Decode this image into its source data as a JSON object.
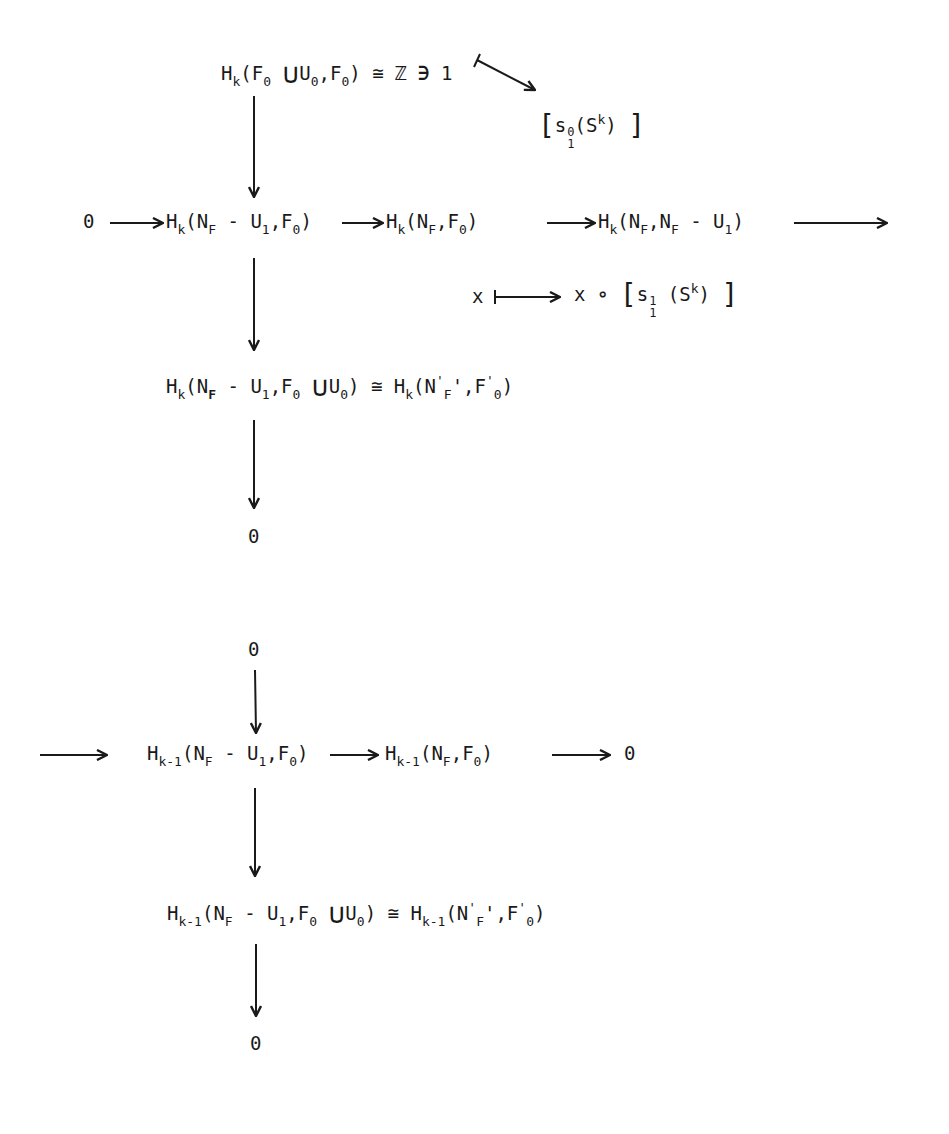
{
  "diagram": {
    "type": "commutative-diagram",
    "nodes": {
      "top_group": {
        "H": "H",
        "k": "k",
        "F": "F",
        "zero": "0",
        "cup": "∪",
        "U": "U",
        "iso": "≅",
        "Z": "ℤ",
        "ni": "∋",
        "one": "1"
      },
      "class_s10": {
        "s": "s",
        "sup": "0",
        "sub": "1",
        "S": "S",
        "k": "k"
      },
      "row1_zero": "0",
      "row1_a": {
        "text": "H_k(N_F - U_1, F_0)"
      },
      "row1_b": {
        "text": "H_k(N_F, F_0)"
      },
      "row1_c": {
        "text": "H_k(N_F, N_F - U_1)"
      },
      "map_label": {
        "x": "x",
        "circ": "∘",
        "s": "s",
        "sup": "1",
        "sub": "1",
        "S": "S",
        "k": "k"
      },
      "mid": {
        "text": "H_k(N_F - U_1, F_0 ∪ U_0) ≅ H_k(N'_F', F'_0)"
      },
      "zero_after_mid": "0",
      "zero_before_row2": "0",
      "row2_a": {
        "text": "H_{k-1}(N_F - U_1, F_0)"
      },
      "row2_b": {
        "text": "H_{k-1}(N_F, F_0)"
      },
      "row2_zero": "0",
      "bottom": {
        "text": "H_{k-1}(N_F - U_1, F_0 ∪ U_0) ≅ H_{k-1}(N'_F', F'_0)"
      },
      "zero_end": "0"
    },
    "labels": {
      "H": "H",
      "k": "k",
      "km1": "k-1",
      "N": "N",
      "F": "F",
      "U": "U",
      "zero": "0",
      "one": "1",
      "minus": "-",
      "comma": ",",
      "lp": "(",
      "rp": ")",
      "cup": "∪",
      "iso": "≅",
      "prime": "'",
      "lb": "[",
      "rb": "]"
    },
    "arrows": [
      {
        "from": "top_group",
        "to": "row1_a",
        "kind": "vertical"
      },
      {
        "from": "one",
        "to": "class_s10",
        "kind": "maps-to"
      },
      {
        "from": "row1_zero",
        "to": "row1_a",
        "kind": "horizontal"
      },
      {
        "from": "row1_a",
        "to": "row1_b",
        "kind": "horizontal"
      },
      {
        "from": "row1_b",
        "to": "row1_c",
        "kind": "horizontal"
      },
      {
        "from": "row1_c",
        "to": "continuation",
        "kind": "horizontal"
      },
      {
        "from": "x",
        "to": "x∘[s_1^1(S^k)]",
        "kind": "maps-to"
      },
      {
        "from": "row1_a",
        "to": "mid",
        "kind": "vertical"
      },
      {
        "from": "mid",
        "to": "zero_after_mid",
        "kind": "vertical"
      },
      {
        "from": "zero_before_row2",
        "to": "row2_a",
        "kind": "vertical"
      },
      {
        "from": "continuation",
        "to": "row2_a",
        "kind": "horizontal"
      },
      {
        "from": "row2_a",
        "to": "row2_b",
        "kind": "horizontal"
      },
      {
        "from": "row2_b",
        "to": "row2_zero",
        "kind": "horizontal"
      },
      {
        "from": "row2_a",
        "to": "bottom",
        "kind": "vertical"
      },
      {
        "from": "bottom",
        "to": "zero_end",
        "kind": "vertical"
      }
    ],
    "colors": {
      "ink": "#1a1a1a",
      "paper": "#ffffff"
    }
  }
}
